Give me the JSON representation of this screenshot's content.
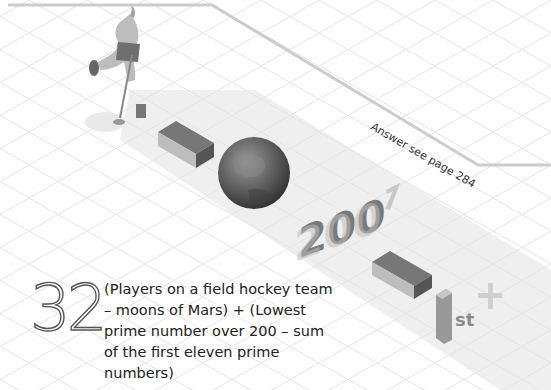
{
  "puzzle": {
    "number": "32",
    "question": "(Players on a field hockey team – moons of Mars) + (Lowest prime number over 200 – sum of the first eleven prime numbers)"
  },
  "answer_note": "Answer see page 284",
  "illustrations": [
    {
      "name": "field-hockey-player",
      "description": "field hockey player illustration"
    },
    {
      "name": "minus-sign-1",
      "description": "3D minus block"
    },
    {
      "name": "mars-planet",
      "description": "planet Mars"
    },
    {
      "name": "number-200",
      "label": "200"
    },
    {
      "name": "question-mark-like-7",
      "label": "?"
    },
    {
      "name": "minus-sign-2",
      "description": "3D minus block"
    },
    {
      "name": "first-eleven-primes",
      "label": "1st"
    },
    {
      "name": "plus-sign",
      "label": "+"
    }
  ],
  "colors": {
    "grid_line": "#e6e6e6",
    "band": "#efefef",
    "path_line": "#cccccc",
    "block_top": "#777777",
    "block_front": "#bdbdbd",
    "block_side": "#555555"
  }
}
